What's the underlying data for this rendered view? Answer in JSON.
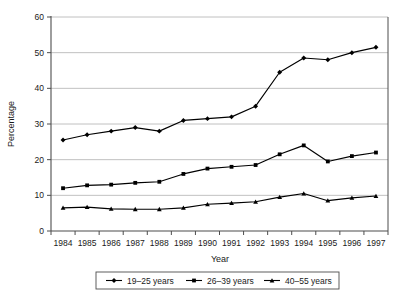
{
  "chart_data": {
    "type": "line",
    "title": "",
    "xlabel": "Year",
    "ylabel": "Percentage",
    "categories": [
      "1984",
      "1985",
      "1986",
      "1987",
      "1988",
      "1989",
      "1990",
      "1991",
      "1992",
      "1993",
      "1994",
      "1995",
      "1996",
      "1997"
    ],
    "x": [
      1984,
      1985,
      1986,
      1987,
      1988,
      1989,
      1990,
      1991,
      1992,
      1993,
      1994,
      1995,
      1996,
      1997
    ],
    "ylim": [
      0,
      60
    ],
    "yticks": [
      0,
      10,
      20,
      30,
      40,
      50,
      60
    ],
    "ytick_labels": [
      "0",
      "10",
      "20",
      "30",
      "40",
      "50",
      "60"
    ],
    "grid": "horizontal",
    "legend_position": "bottom",
    "series": [
      {
        "name": "19–25 years",
        "marker": "diamond",
        "values": [
          25.5,
          27.0,
          28.0,
          29.0,
          28.0,
          31.0,
          31.5,
          32.0,
          35.0,
          44.5,
          48.5,
          48.0,
          50.0,
          51.5
        ]
      },
      {
        "name": "26–39 years",
        "marker": "square",
        "values": [
          12.0,
          12.8,
          13.0,
          13.5,
          13.8,
          16.0,
          17.5,
          18.0,
          18.5,
          21.5,
          24.0,
          19.5,
          21.0,
          22.0
        ]
      },
      {
        "name": "40–55 years",
        "marker": "triangle",
        "values": [
          6.5,
          6.7,
          6.2,
          6.1,
          6.1,
          6.5,
          7.5,
          7.8,
          8.2,
          9.5,
          10.5,
          8.5,
          9.3,
          9.8
        ]
      }
    ],
    "colors": {
      "line": "#000000",
      "grid": "#b0b0b0",
      "frame": "#4d4d4d",
      "background": "#ffffff"
    }
  }
}
